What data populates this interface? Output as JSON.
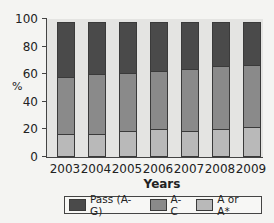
{
  "chart_data": {
    "type": "bar",
    "stacked": false,
    "overlay_note": "Cumulative bars: each series value is the cumulative height from 0; segments are drawn overlapping (A or A* within A-C within Pass)",
    "title": "",
    "xlabel": "Years",
    "ylabel": "%",
    "ylim": [
      0,
      100
    ],
    "yticks": [
      0,
      20,
      40,
      60,
      80,
      100
    ],
    "categories": [
      "2003",
      "2004",
      "2005",
      "2006",
      "2007",
      "2008",
      "2009"
    ],
    "series": [
      {
        "name": "Pass (A-G)",
        "color": "#4a4a4a",
        "values": [
          98,
          98,
          98,
          98,
          98,
          98,
          98
        ]
      },
      {
        "name": "A-C",
        "color": "#8a8a8a",
        "values": [
          58,
          60,
          61,
          62,
          64,
          66,
          67
        ]
      },
      {
        "name": "A or A*",
        "color": "#b9b9b9",
        "values": [
          17,
          17,
          19,
          20,
          19,
          20,
          22
        ]
      }
    ],
    "legend_position": "bottom",
    "grid": false
  },
  "axis": {
    "y_labels": [
      "0",
      "20",
      "40",
      "60",
      "80",
      "100"
    ],
    "y_title": "%",
    "x_title": "Years"
  },
  "legend": {
    "items": [
      {
        "label": "Pass (A-G)",
        "color": "#4a4a4a"
      },
      {
        "label": "A-C",
        "color": "#8a8a8a"
      },
      {
        "label": "A or A*",
        "color": "#b9b9b9"
      }
    ]
  }
}
